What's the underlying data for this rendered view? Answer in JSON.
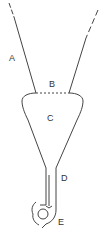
{
  "diagram": {
    "type": "funnel-schematic",
    "labels": {
      "a": "A",
      "b": "B",
      "c": "C",
      "d": "D",
      "e": "E"
    },
    "colors": {
      "line": "#444444",
      "text": "#333333",
      "background": "#ffffff"
    }
  }
}
